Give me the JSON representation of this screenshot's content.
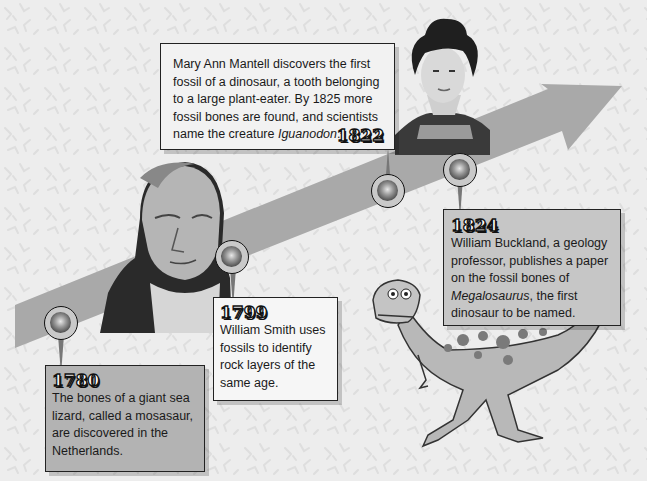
{
  "timeline": {
    "events": [
      {
        "year": "1780",
        "description": "The bones of a giant sea lizard, called a mosasaur, are discovered in the Netherlands."
      },
      {
        "year": "1799",
        "description": "William Smith uses fossils to identify rock layers of the same age."
      },
      {
        "year": "1822",
        "description_prefix": "Mary Ann Mantell discovers the first fossil of a dinosaur, a tooth belonging to a large plant-eater. By 1825 more fossil bones are found, and scientists name the creature ",
        "description_italic": "Iguanodon",
        "description_suffix": "."
      },
      {
        "year": "1824",
        "description_prefix": "William Buckland, a geology professor, publishes a paper on the fossil bones of ",
        "description_italic": "Megalosaurus",
        "description_suffix": ", the first dinosaur to be named."
      }
    ]
  },
  "illustrations": {
    "portrait_smith": "portrait of William Smith",
    "portrait_mantell": "portrait of Mary Ann Mantell",
    "dinosaur": "Megalosaurus illustration"
  },
  "colors": {
    "background": "#ededed",
    "arrow": "#a9a9a9",
    "box_dark": "#b3b3b3",
    "box_light": "#f4f4f4",
    "box_mid": "#c6c6c6"
  }
}
